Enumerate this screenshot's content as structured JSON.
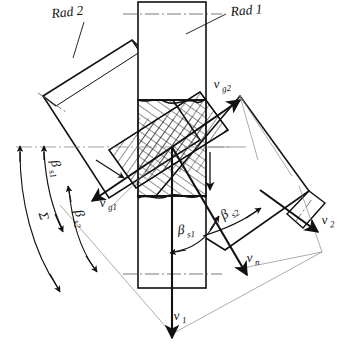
{
  "figure": {
    "background_color": "#ffffff",
    "line_color": "#111111",
    "hatch_color": "#222222",
    "thin_color": "#555555"
  },
  "parts": {
    "rad1": {
      "label": "Rad 1",
      "description": "vertical shaft/gear body of wheel 1",
      "leader": true
    },
    "rad2": {
      "label": "Rad 2",
      "description": "inclined shaft/gear body of wheel 2 upper-left",
      "leader": true
    },
    "rad2_right": {
      "description": "inclined shaft/gear body of wheel 2 lower-right arm"
    },
    "contact_zone": {
      "description": "cross-hatched sectioned overlap at the tooth contact point"
    }
  },
  "vectors": [
    {
      "name": "v_g2",
      "label": "v",
      "sub": "g2",
      "description": "sliding velocity component of wheel 2, arrow up-right"
    },
    {
      "name": "v_g1",
      "label": "v",
      "sub": "g1",
      "description": "sliding velocity component of wheel 1, arrow down-left"
    },
    {
      "name": "v_n",
      "label": "v",
      "sub": "n",
      "description": "normal velocity, arrow down-right"
    },
    {
      "name": "v_1",
      "label": "v",
      "sub": "1",
      "description": "peripheral velocity of wheel 1, arrow straight down"
    },
    {
      "name": "v_2",
      "label": "v",
      "sub": "2",
      "description": "peripheral velocity of wheel 2, arrow down-right at far right"
    },
    {
      "name": "v_unlabelled",
      "label": "",
      "sub": "",
      "description": "short unlabelled downward arrow right of centre"
    }
  ],
  "angles": [
    {
      "name": "beta_s1_left",
      "label": "β",
      "sub": "s1",
      "description": "helix angle of wheel 1 measured from horizontal datum, left arc"
    },
    {
      "name": "sigma",
      "label": "Σ",
      "sub": "",
      "description": "shaft crossing angle, long left arc"
    },
    {
      "name": "beta_s2_left",
      "label": "β",
      "sub": "s2",
      "description": "helix angle of wheel 2, left arc"
    },
    {
      "name": "beta_s1_centre",
      "label": "β",
      "sub": "s1",
      "description": "helix angle of wheel 1 at centre, arc to v_1"
    },
    {
      "name": "beta_s2_right",
      "label": "β",
      "sub": "s2",
      "description": "helix angle of wheel 2 at right, arc to v_2"
    }
  ],
  "labels": {
    "rad1": "Rad 1",
    "rad2": "Rad 2",
    "v_base": "v",
    "sub_g2": "g2",
    "sub_g1": "g1",
    "sub_n": "n",
    "sub_1": "1",
    "sub_2": "2",
    "beta": "β",
    "sub_s1": "s1",
    "sub_s2": "s2",
    "sigma": "Σ"
  }
}
